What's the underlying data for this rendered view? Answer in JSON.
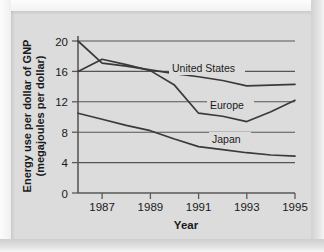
{
  "chart_data": {
    "type": "line",
    "title": "",
    "xlabel": "Year",
    "ylabel": "Energy use per dollar of GNP (megajoules per dollar)",
    "ylabel_line1": "Energy use per dollar of GNP",
    "ylabel_line2": "(megajoules per dollar)",
    "x": [
      1986,
      1987,
      1988,
      1989,
      1990,
      1991,
      1992,
      1993,
      1994,
      1995
    ],
    "xlim": [
      1986,
      1995
    ],
    "ylim": [
      0,
      20
    ],
    "xticks": [
      1987,
      1989,
      1991,
      1993,
      1995
    ],
    "xtick_labels": [
      "1987",
      "1989",
      "1991",
      "1993",
      "1995"
    ],
    "yticks": [
      0,
      4,
      8,
      12,
      16,
      20
    ],
    "ytick_labels": [
      "0",
      "4",
      "8",
      "12",
      "16",
      "20"
    ],
    "grid": "horizontal",
    "legend_position": "inline-labels",
    "series": [
      {
        "name": "United States",
        "label": "United States",
        "values": [
          20.0,
          17.1,
          16.7,
          16.2,
          15.7,
          15.3,
          14.8,
          14.1,
          14.2,
          14.3
        ]
      },
      {
        "name": "Europe",
        "label": "Europe",
        "values": [
          16.0,
          17.6,
          16.9,
          16.1,
          14.2,
          10.5,
          10.1,
          9.4,
          10.7,
          12.2
        ]
      },
      {
        "name": "Japan",
        "label": "Japan",
        "values": [
          10.5,
          9.7,
          8.9,
          8.2,
          7.1,
          6.1,
          5.7,
          5.3,
          5.0,
          4.85
        ]
      }
    ],
    "colors": {
      "line": "#3a3a3a",
      "grid": "#555555",
      "axis": "#595959",
      "panel_background": "#dcdcdc",
      "frame_background": "#e8e8e8",
      "text": "#1a1a1a"
    }
  }
}
